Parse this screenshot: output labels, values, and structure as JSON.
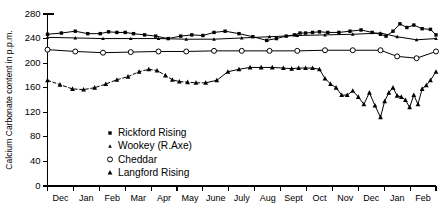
{
  "chart_data": {
    "type": "line",
    "title": "",
    "xlabel": "",
    "ylabel": "Calcium  Carbonate content in p.p.m.",
    "ylim": [
      0,
      280
    ],
    "yticks": [
      0,
      40,
      80,
      120,
      160,
      200,
      240,
      280
    ],
    "ytick_labels": [
      "0",
      "40",
      "80",
      "120",
      "160",
      "200",
      "240",
      "280"
    ],
    "grid": false,
    "legend_position": "lower-left-inside",
    "categories": [
      "Dec",
      "Jan",
      "Feb",
      "Mar",
      "Apr",
      "May",
      "June",
      "July",
      "Aug",
      "Sept",
      "Oct",
      "Nov",
      "Dec",
      "Jan",
      "Feb"
    ],
    "xtick_labels": [
      "Dec",
      "Jan",
      "Feb",
      "Mar",
      "Apr",
      "May",
      "June",
      "July",
      "Aug",
      "Sept",
      "Oct",
      "Nov",
      "Dec",
      "Jan",
      "Feb"
    ],
    "series": [
      {
        "name": "Rickford Rising",
        "marker": "filled-square",
        "line_style": "solid",
        "x": [
          0.0,
          0.5,
          1.0,
          1.45,
          1.9,
          2.2,
          2.5,
          2.8,
          3.1,
          3.5,
          3.9,
          4.35,
          4.8,
          5.2,
          5.6,
          6.0,
          6.4,
          6.9,
          7.4,
          7.9,
          8.25,
          8.6,
          8.9,
          9.1,
          9.3,
          9.55,
          9.8,
          10.1,
          10.5,
          10.9,
          11.3,
          11.7,
          12.0,
          12.2,
          12.45,
          12.7,
          12.95,
          13.2,
          13.5,
          13.8,
          14.0
        ],
        "y": [
          247,
          249,
          252,
          248,
          248,
          251,
          250,
          250,
          248,
          246,
          244,
          240,
          244,
          246,
          245,
          250,
          252,
          248,
          243,
          237,
          240,
          244,
          246,
          249,
          249,
          250,
          251,
          250,
          250,
          252,
          254,
          250,
          247,
          244,
          252,
          264,
          258,
          262,
          256,
          255,
          246
        ],
        "comment": "upper solid curve with filled square markers, roughly 237-264 ppm"
      },
      {
        "name": "Wookey (R.Axe)",
        "marker": "small-triangle",
        "line_style": "solid",
        "x": [
          0.0,
          1.0,
          2.0,
          3.0,
          4.0,
          5.0,
          6.0,
          7.0,
          8.0,
          9.0,
          10.0,
          11.0,
          12.0,
          12.6,
          13.3,
          14.0
        ],
        "y": [
          242,
          241,
          240,
          240,
          240,
          239,
          239,
          241,
          243,
          245,
          246,
          247,
          249,
          243,
          238,
          240
        ],
        "comment": "near-flat solid curve about 238-249 ppm, tiny triangle markers"
      },
      {
        "name": "Cheddar",
        "marker": "open-circle",
        "line_style": "solid",
        "x": [
          0.0,
          1.0,
          2.0,
          3.0,
          4.0,
          5.0,
          6.0,
          7.0,
          8.0,
          9.0,
          10.0,
          11.0,
          12.0,
          12.6,
          13.3,
          14.0
        ],
        "y": [
          222,
          219,
          217,
          218,
          219,
          219,
          220,
          220,
          220,
          220,
          221,
          221,
          221,
          211,
          208,
          219
        ],
        "comment": "flat solid curve about 208-222 ppm with open circle markers"
      },
      {
        "name": "Langford Rising",
        "marker": "filled-triangle",
        "line_style": "dashed-then-solid",
        "x": [
          0.0,
          0.45,
          0.9,
          1.3,
          1.7,
          2.1,
          2.5,
          2.9,
          3.3,
          3.65,
          3.95,
          4.25,
          4.5,
          4.75,
          5.05,
          5.35,
          5.7,
          6.1,
          6.5,
          6.9,
          7.3,
          7.7,
          8.1,
          8.5,
          8.8,
          9.05,
          9.3,
          9.55,
          9.8,
          10.0,
          10.2,
          10.4,
          10.6,
          10.8,
          11.0,
          11.2,
          11.4,
          11.6,
          11.8,
          12.0,
          12.15,
          12.3,
          12.45,
          12.6,
          12.75,
          12.9,
          13.05,
          13.2,
          13.35,
          13.5,
          13.65,
          13.8,
          14.0
        ],
        "y": [
          172,
          165,
          158,
          157,
          160,
          166,
          173,
          178,
          186,
          190,
          188,
          180,
          173,
          170,
          169,
          168,
          168,
          172,
          186,
          190,
          193,
          193,
          193,
          192,
          191,
          192,
          192,
          192,
          190,
          175,
          166,
          160,
          148,
          148,
          155,
          145,
          133,
          152,
          131,
          112,
          138,
          152,
          160,
          147,
          145,
          140,
          128,
          148,
          133,
          158,
          164,
          172,
          186
        ],
        "comment": "lowest curve, dashed from Dec through May then solid; drops sharply after Oct with spiky minima near 112 ppm"
      }
    ]
  },
  "legend": {
    "items": [
      {
        "label": "Rickford Rising",
        "marker": "filled-square"
      },
      {
        "label": "Wookey (R.Axe)",
        "marker": "small-triangle"
      },
      {
        "label": "Cheddar",
        "marker": "open-circle"
      },
      {
        "label": "Langford Rising",
        "marker": "filled-triangle"
      }
    ]
  },
  "colors": {
    "ink": "#000000",
    "paper": "#ffffff"
  }
}
